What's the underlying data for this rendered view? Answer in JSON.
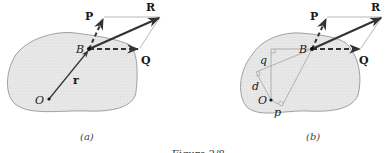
{
  "figure": {
    "caption": "Figure 2/8",
    "panels": [
      {
        "id": "a",
        "label": "(a)",
        "points": {
          "origin": "O",
          "point": "B"
        },
        "vectors": {
          "P": "P",
          "Q": "Q",
          "R": "R",
          "r": "r"
        }
      },
      {
        "id": "b",
        "label": "(b)",
        "points": {
          "origin": "O",
          "point": "B"
        },
        "vectors": {
          "P": "P",
          "Q": "Q",
          "R": "R"
        },
        "distances": {
          "p": "p",
          "q": "q",
          "d": "d"
        }
      }
    ]
  },
  "colors": {
    "body_fill": "#e6e6e6",
    "body_outline": "#8a8a8a",
    "vector": "#333333",
    "construction": "#999999"
  }
}
